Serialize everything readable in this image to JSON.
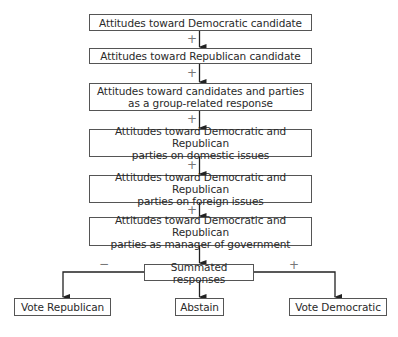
{
  "diagram": {
    "steps": [
      {
        "lines": [
          "Attitudes toward Democratic candidate"
        ]
      },
      {
        "lines": [
          "Attitudes toward Republican candidate"
        ]
      },
      {
        "lines": [
          "Attitudes toward candidates and parties",
          "as a group-related response"
        ]
      },
      {
        "lines": [
          "Attitudes toward Democratic and Republican",
          "parties on domestic issues"
        ]
      },
      {
        "lines": [
          "Attitudes toward Democratic and Republican",
          "parties on foreign issues"
        ]
      },
      {
        "lines": [
          "Attitudes toward Democratic and Republican",
          "parties as manager of government"
        ]
      }
    ],
    "connector_signs": [
      "+",
      "+",
      "+",
      "+",
      "+"
    ],
    "summation": {
      "label": "Summated responses"
    },
    "outcomes": {
      "left": {
        "label": "Vote Republican",
        "sign": "−"
      },
      "center": {
        "label": "Abstain"
      },
      "right": {
        "label": "Vote Democratic",
        "sign": "+"
      }
    }
  }
}
